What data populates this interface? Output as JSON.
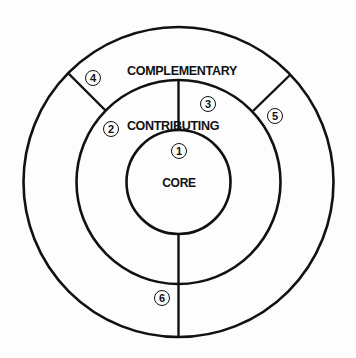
{
  "diagram": {
    "type": "concentric-rings",
    "rings": [
      {
        "name": "core",
        "label": "CORE"
      },
      {
        "name": "contributing",
        "label": "CONTRIBUTING"
      },
      {
        "name": "complementary",
        "label": "COMPLEMENTARY"
      }
    ],
    "markers": [
      {
        "id": "1",
        "label": "1"
      },
      {
        "id": "2",
        "label": "2"
      },
      {
        "id": "3",
        "label": "3"
      },
      {
        "id": "4",
        "label": "4"
      },
      {
        "id": "5",
        "label": "5"
      },
      {
        "id": "6",
        "label": "6"
      }
    ],
    "stroke_color": "#111111",
    "background_color": "#fdfdfd"
  }
}
